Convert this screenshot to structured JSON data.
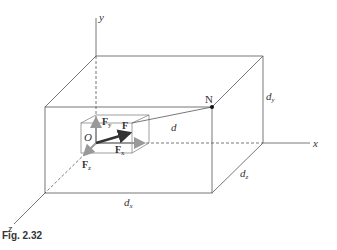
{
  "figure": {
    "caption": "Fig. 2.32",
    "axes": {
      "x": "x",
      "y": "y",
      "z": "z"
    },
    "point_label": "N",
    "origin_label": "O",
    "distance_label": "d",
    "dimension_labels": {
      "dx": "d",
      "dx_sub": "x",
      "dy": "d",
      "dy_sub": "y",
      "dz": "d",
      "dz_sub": "z"
    },
    "force_labels": {
      "F": "F",
      "Fx": "F",
      "Fx_sub": "x",
      "Fy": "F",
      "Fy_sub": "y",
      "Fz": "F",
      "Fz_sub": "z"
    },
    "colors": {
      "line": "#555555",
      "vector": "#333333",
      "component": "#9a9a9a"
    }
  }
}
